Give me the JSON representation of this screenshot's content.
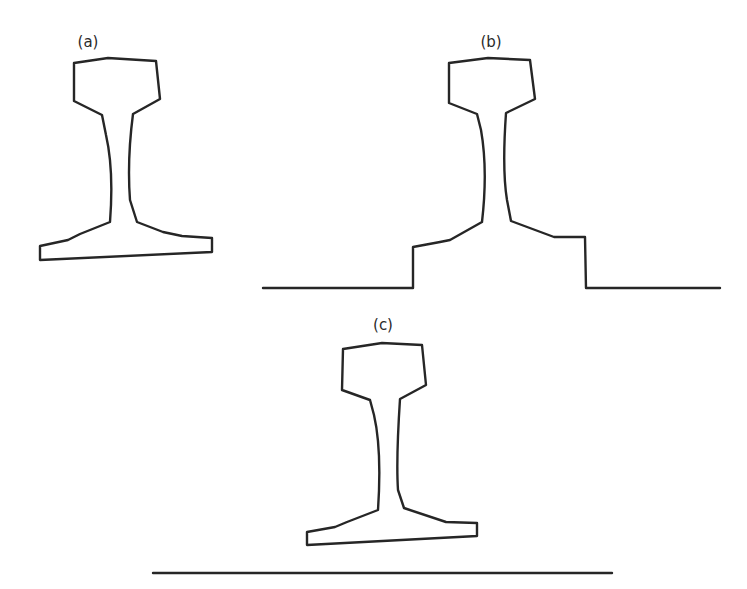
{
  "figure": {
    "panels": [
      {
        "id": "a",
        "label": "(a)",
        "description": "Rail section standing alone, no support"
      },
      {
        "id": "b",
        "label": "(b)",
        "description": "Rail section with foot embedded in stepped support (ground line)"
      },
      {
        "id": "c",
        "label": "(c)",
        "description": "Rail section resting above a flat ground line"
      }
    ],
    "stroke_color": "#262626",
    "background": "#ffffff"
  }
}
